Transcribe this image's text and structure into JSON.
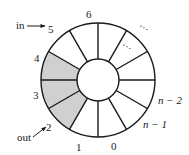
{
  "diagram": {
    "center": [
      98,
      80
    ],
    "outer_radius": 57,
    "inner_radius": 21,
    "segment_count": 12,
    "colors": {
      "stroke": "#1a1a1a",
      "shaded_fill": "#d0d0d0",
      "background": "#ffffff",
      "text": "#222222"
    },
    "slot_labels": [
      {
        "text": "6",
        "x": 86,
        "y": 18,
        "italic": false
      },
      {
        "text": "5",
        "x": 48,
        "y": 33,
        "italic": false
      },
      {
        "text": "4",
        "x": 34,
        "y": 62,
        "italic": false
      },
      {
        "text": "3",
        "x": 33,
        "y": 99,
        "italic": false
      },
      {
        "text": "2",
        "x": 46,
        "y": 131,
        "italic": false
      },
      {
        "text": "1",
        "x": 76,
        "y": 151,
        "italic": false
      },
      {
        "text": "0",
        "x": 111,
        "y": 150,
        "italic": false
      },
      {
        "text": "n − 1",
        "x": 143,
        "y": 128,
        "italic": true
      },
      {
        "text": "n − 2",
        "x": 158,
        "y": 104,
        "italic": true
      }
    ],
    "ellipses": [
      {
        "text": "⋯",
        "x": 144,
        "y": 31,
        "rotate": 30
      },
      {
        "text": "⋯",
        "x": 127,
        "y": 50,
        "rotate": 30
      }
    ],
    "shaded_slots": [
      "4",
      "3",
      "2"
    ],
    "pointers": {
      "in": {
        "label": "in",
        "points_to": "5",
        "label_x": 16,
        "label_y": 29,
        "arrow_from": [
          27,
          26
        ],
        "arrow_to": [
          45,
          26
        ]
      },
      "out": {
        "label": "out",
        "points_to": "2",
        "label_x": 17,
        "label_y": 141,
        "arrow_from": [
          33,
          137
        ],
        "arrow_to": [
          46,
          127
        ]
      }
    }
  }
}
